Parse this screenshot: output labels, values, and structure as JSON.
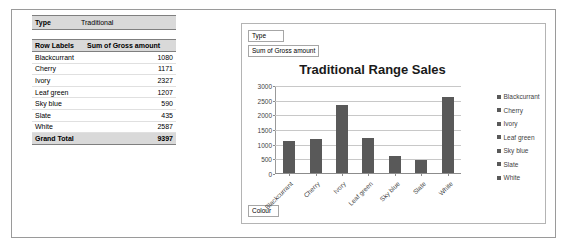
{
  "pivot_table": {
    "filter": {
      "label": "Type",
      "value": "Traditional"
    },
    "headers": {
      "row_labels": "Row Labels",
      "value": "Sum of Gross amount"
    },
    "rows": [
      {
        "label": "Blackcurrant",
        "value": "1080"
      },
      {
        "label": "Cherry",
        "value": "1171"
      },
      {
        "label": "Ivory",
        "value": "2327"
      },
      {
        "label": "Leaf green",
        "value": "1207"
      },
      {
        "label": "Sky blue",
        "value": "590"
      },
      {
        "label": "Slate",
        "value": "435"
      },
      {
        "label": "White",
        "value": "2587"
      }
    ],
    "grand_total": {
      "label": "Grand Total",
      "value": "9397"
    }
  },
  "chart_panel": {
    "field_buttons": {
      "filter": "Type",
      "values": "Sum of Gross amount",
      "axis": "Colour"
    }
  },
  "chart_data": {
    "type": "bar",
    "title": "Traditional Range Sales",
    "xlabel": "",
    "ylabel": "",
    "categories": [
      "Blackcurrant",
      "Cherry",
      "Ivory",
      "Leaf green",
      "Sky blue",
      "Slate",
      "White"
    ],
    "values": [
      1080,
      1171,
      2327,
      1207,
      590,
      435,
      2587
    ],
    "series": [
      {
        "name": "Sum of Gross amount",
        "values": [
          1080,
          1171,
          2327,
          1207,
          590,
          435,
          2587
        ]
      }
    ],
    "ylim": [
      0,
      3000
    ],
    "yticks": [
      0,
      500,
      1000,
      1500,
      2000,
      2500,
      3000
    ],
    "ytick_labels": [
      "0",
      "500",
      "1000",
      "1500",
      "2000",
      "2500",
      "3000"
    ],
    "grid": true,
    "legend_position": "right",
    "legend": [
      "Blackcurrant",
      "Cherry",
      "Ivory",
      "Leaf green",
      "Sky blue",
      "Slate",
      "White"
    ],
    "bar_color": "#595959",
    "gridline_color": "#c8c8c8"
  }
}
